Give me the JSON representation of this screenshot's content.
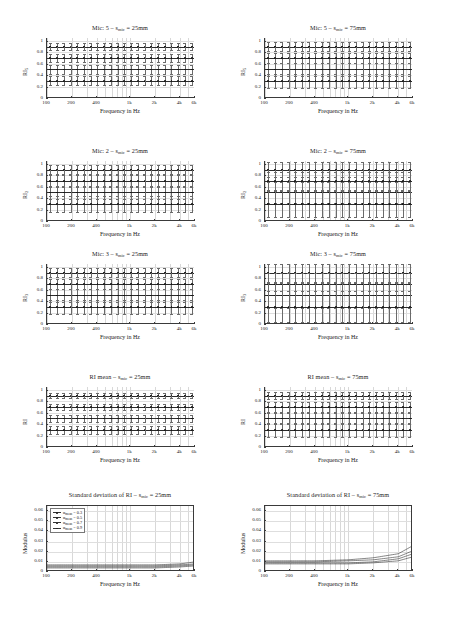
{
  "figure": {
    "width": 458,
    "height": 617,
    "xlabel": "Frequency in Hz",
    "xticklabels": [
      "100",
      "200",
      "400",
      "1k",
      "2k",
      "4k",
      "6k"
    ],
    "ri_yticklabels": [
      "0",
      "0.2",
      "0.4",
      "0.6",
      "0.8",
      "1"
    ],
    "std_yticklabels": [
      "0",
      "0.01",
      "0.02",
      "0.03",
      "0.04",
      "0.05",
      "0.06"
    ]
  },
  "panels": [
    {
      "id": "mic5-25",
      "title_main": "Mic: 5 – s",
      "title_sub": "mic",
      "title_tail": " = 25mm",
      "ylabel_main": "RI",
      "ylabel_sub": "5",
      "kind": "ri"
    },
    {
      "id": "mic5-75",
      "title_main": "Mic: 5 – s",
      "title_sub": "mic",
      "title_tail": " = 75mm",
      "ylabel_main": "RI",
      "ylabel_sub": "5",
      "kind": "ri"
    },
    {
      "id": "mic2-25",
      "title_main": "Mic: 2 – s",
      "title_sub": "mic",
      "title_tail": " = 25mm",
      "ylabel_main": "RI",
      "ylabel_sub": "2",
      "kind": "ri"
    },
    {
      "id": "mic2-75",
      "title_main": "Mic: 2 – s",
      "title_sub": "mic",
      "title_tail": " = 75mm",
      "ylabel_main": "RI",
      "ylabel_sub": "2",
      "kind": "ri"
    },
    {
      "id": "mic3-25",
      "title_main": "Mic: 3 – s",
      "title_sub": "mic",
      "title_tail": " = 25mm",
      "ylabel_main": "RI",
      "ylabel_sub": "3",
      "kind": "ri"
    },
    {
      "id": "mic3-75",
      "title_main": "Mic: 3 – s",
      "title_sub": "mic",
      "title_tail": " = 75mm",
      "ylabel_main": "RI",
      "ylabel_sub": "3",
      "kind": "ri"
    },
    {
      "id": "rimean-25",
      "title_main": "RI mean – s",
      "title_sub": "mic",
      "title_tail": " = 25mm",
      "ylabel_main": "RI",
      "ylabel_sub": "",
      "kind": "ri"
    },
    {
      "id": "rimean-75",
      "title_main": "RI mean – s",
      "title_sub": "mic",
      "title_tail": " = 75mm",
      "ylabel_main": "RI",
      "ylabel_sub": "",
      "kind": "ri"
    },
    {
      "id": "std-25",
      "title_main": "Standard deviation of RI – s",
      "title_sub": "mic",
      "title_tail": " = 25mm",
      "ylabel_main": "Modulus",
      "ylabel_sub": "",
      "kind": "std"
    },
    {
      "id": "std-75",
      "title_main": "Standard deviation of RI – s",
      "title_sub": "mic",
      "title_tail": " = 75mm",
      "ylabel_main": "Modulus",
      "ylabel_sub": "",
      "kind": "std"
    }
  ],
  "legend": {
    "entries": [
      {
        "symbol_text": "α",
        "sub": "mean",
        "value": " = 0.3"
      },
      {
        "symbol_text": "α",
        "sub": "mean",
        "value": " = 0.5"
      },
      {
        "symbol_text": "α",
        "sub": "mean",
        "value": " = 0.7"
      },
      {
        "symbol_text": "α",
        "sub": "mean",
        "value": " = 0.9"
      }
    ]
  },
  "chart_data": {
    "type": "line",
    "xlabel": "Frequency in Hz",
    "ylabel_ri": "RI",
    "ylabel_std": "Modulus",
    "xscale": "log",
    "xlim": [
      100,
      6000
    ],
    "xticks": [
      100,
      200,
      400,
      1000,
      2000,
      4000,
      6000
    ],
    "xticklabels": [
      "100",
      "200",
      "400",
      "1k",
      "2k",
      "4k",
      "6k"
    ],
    "ri_ylim": [
      0,
      1.05
    ],
    "ri_yticks": [
      0,
      0.2,
      0.4,
      0.6,
      0.8,
      1
    ],
    "std_ylim": [
      0,
      0.065
    ],
    "std_yticks": [
      0,
      0.01,
      0.02,
      0.03,
      0.04,
      0.05,
      0.06
    ],
    "legend_position": "upper-left",
    "grid": true,
    "series_names": [
      "αmean = 0.3",
      "αmean = 0.5",
      "αmean = 0.7",
      "αmean = 0.9"
    ],
    "ri_levels": [
      0.9,
      0.7,
      0.5,
      0.3
    ],
    "panels": [
      {
        "id": "mic5-25",
        "title": "Mic: 5 - smic = 25mm",
        "ylabel": "RI5",
        "type": "errorbar-flat",
        "series": [
          {
            "name": "αmean = 0.3",
            "level": 0.9,
            "errorbar": 0.012
          },
          {
            "name": "αmean = 0.5",
            "level": 0.7,
            "errorbar": 0.014
          },
          {
            "name": "αmean = 0.7",
            "level": 0.5,
            "errorbar": 0.016
          },
          {
            "name": "αmean = 0.9",
            "level": 0.3,
            "errorbar": 0.018
          }
        ]
      },
      {
        "id": "mic5-75",
        "title": "Mic: 5 - smic = 75mm",
        "ylabel": "RI5",
        "type": "errorbar-flat",
        "series": [
          {
            "name": "αmean = 0.3",
            "level": 0.9,
            "errorbar": 0.016
          },
          {
            "name": "αmean = 0.5",
            "level": 0.7,
            "errorbar": 0.02
          },
          {
            "name": "αmean = 0.7",
            "level": 0.5,
            "errorbar": 0.024
          },
          {
            "name": "αmean = 0.9",
            "level": 0.3,
            "errorbar": 0.028
          }
        ]
      },
      {
        "id": "mic2-25",
        "title": "Mic: 2 - smic = 25mm",
        "ylabel": "RI2",
        "type": "errorbar-flat",
        "series": [
          {
            "name": "αmean = 0.3",
            "level": 0.9,
            "errorbar": 0.018
          },
          {
            "name": "αmean = 0.5",
            "level": 0.7,
            "errorbar": 0.022
          },
          {
            "name": "αmean = 0.7",
            "level": 0.5,
            "errorbar": 0.026
          },
          {
            "name": "αmean = 0.9",
            "level": 0.3,
            "errorbar": 0.03
          }
        ]
      },
      {
        "id": "mic2-75",
        "title": "Mic: 2 - smic = 75mm",
        "ylabel": "RI2",
        "type": "errorbar-flat",
        "series": [
          {
            "name": "αmean = 0.3",
            "level": 0.9,
            "errorbar": 0.03
          },
          {
            "name": "αmean = 0.5",
            "level": 0.7,
            "errorbar": 0.036
          },
          {
            "name": "αmean = 0.7",
            "level": 0.5,
            "errorbar": 0.042
          },
          {
            "name": "αmean = 0.9",
            "level": 0.3,
            "errorbar": 0.05
          }
        ]
      },
      {
        "id": "mic3-25",
        "title": "Mic: 3 - smic = 25mm",
        "ylabel": "RI3",
        "type": "errorbar-flat",
        "series": [
          {
            "name": "αmean = 0.3",
            "level": 0.9,
            "errorbar": 0.016
          },
          {
            "name": "αmean = 0.5",
            "level": 0.7,
            "errorbar": 0.02
          },
          {
            "name": "αmean = 0.7",
            "level": 0.5,
            "errorbar": 0.024
          },
          {
            "name": "αmean = 0.9",
            "level": 0.3,
            "errorbar": 0.028
          }
        ]
      },
      {
        "id": "mic3-75",
        "title": "Mic: 3 - smic = 75mm",
        "ylabel": "RI3",
        "type": "errorbar-flat",
        "series": [
          {
            "name": "αmean = 0.3",
            "level": 0.9,
            "errorbar": 0.035
          },
          {
            "name": "αmean = 0.5",
            "level": 0.7,
            "errorbar": 0.042
          },
          {
            "name": "αmean = 0.7",
            "level": 0.5,
            "errorbar": 0.05
          },
          {
            "name": "αmean = 0.9",
            "level": 0.3,
            "errorbar": 0.06
          }
        ]
      },
      {
        "id": "rimean-25",
        "title": "RI mean - smic = 25mm",
        "ylabel": "RI",
        "type": "errorbar-flat",
        "series": [
          {
            "name": "αmean = 0.3",
            "level": 0.9,
            "errorbar": 0.01
          },
          {
            "name": "αmean = 0.5",
            "level": 0.7,
            "errorbar": 0.012
          },
          {
            "name": "αmean = 0.7",
            "level": 0.5,
            "errorbar": 0.014
          },
          {
            "name": "αmean = 0.9",
            "level": 0.3,
            "errorbar": 0.016
          }
        ]
      },
      {
        "id": "rimean-75",
        "title": "RI mean - smic = 75mm",
        "ylabel": "RI",
        "type": "errorbar-flat",
        "series": [
          {
            "name": "αmean = 0.3",
            "level": 0.9,
            "errorbar": 0.014
          },
          {
            "name": "αmean = 0.5",
            "level": 0.7,
            "errorbar": 0.018
          },
          {
            "name": "αmean = 0.7",
            "level": 0.5,
            "errorbar": 0.022
          },
          {
            "name": "αmean = 0.9",
            "level": 0.3,
            "errorbar": 0.026
          }
        ]
      },
      {
        "id": "std-25",
        "title": "Standard deviation of RI - smic = 25mm",
        "ylabel": "Modulus",
        "type": "line",
        "x": [
          100,
          200,
          400,
          1000,
          2000,
          4000,
          6000
        ],
        "series": [
          {
            "name": "αmean = 0.3",
            "values": [
              0.004,
              0.004,
              0.004,
              0.004,
              0.004,
              0.005,
              0.006
            ]
          },
          {
            "name": "αmean = 0.5",
            "values": [
              0.005,
              0.005,
              0.005,
              0.005,
              0.005,
              0.006,
              0.007
            ]
          },
          {
            "name": "αmean = 0.7",
            "values": [
              0.006,
              0.006,
              0.006,
              0.006,
              0.006,
              0.007,
              0.008
            ]
          },
          {
            "name": "αmean = 0.9",
            "values": [
              0.007,
              0.007,
              0.007,
              0.007,
              0.007,
              0.008,
              0.01
            ]
          }
        ]
      },
      {
        "id": "std-75",
        "title": "Standard deviation of RI - smic = 75mm",
        "ylabel": "Modulus",
        "type": "line",
        "x": [
          100,
          200,
          400,
          1000,
          2000,
          4000,
          6000
        ],
        "series": [
          {
            "name": "αmean = 0.3",
            "values": [
              0.008,
              0.008,
              0.008,
              0.008,
              0.009,
              0.011,
              0.015
            ]
          },
          {
            "name": "αmean = 0.5",
            "values": [
              0.009,
              0.009,
              0.009,
              0.009,
              0.01,
              0.013,
              0.018
            ]
          },
          {
            "name": "αmean = 0.7",
            "values": [
              0.01,
              0.01,
              0.01,
              0.011,
              0.012,
              0.015,
              0.021
            ]
          },
          {
            "name": "αmean = 0.9",
            "values": [
              0.011,
              0.011,
              0.011,
              0.012,
              0.014,
              0.018,
              0.026
            ]
          }
        ]
      }
    ]
  }
}
